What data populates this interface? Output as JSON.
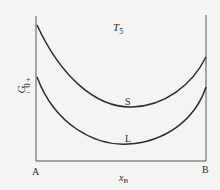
{
  "diagram": {
    "title": "T5",
    "title_main": "T",
    "title_sub": "5",
    "y_axis_label": "G",
    "y_zero_label": "0",
    "y_plus": "+",
    "y_minus": "−",
    "x_axis_label_main": "x",
    "x_axis_label_sub": "B",
    "left_end_label": "A",
    "right_end_label": "B",
    "curves": [
      {
        "name": "S",
        "label": "S"
      },
      {
        "name": "L",
        "label": "L"
      }
    ],
    "line_color": "#2a2a2a"
  }
}
